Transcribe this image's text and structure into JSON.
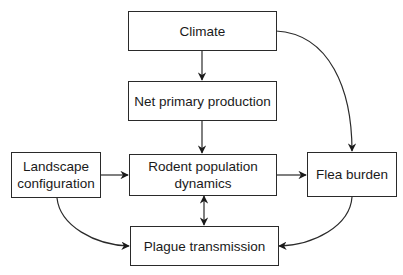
{
  "diagram": {
    "type": "flowchart",
    "nodes": [
      {
        "id": "climate",
        "label": "Climate"
      },
      {
        "id": "npp",
        "label": "Net primary production"
      },
      {
        "id": "landscape",
        "label": "Landscape configuration"
      },
      {
        "id": "rodent",
        "label": "Rodent population dynamics"
      },
      {
        "id": "flea",
        "label": "Flea burden"
      },
      {
        "id": "plague",
        "label": "Plague transmission"
      }
    ],
    "edges": [
      {
        "from": "climate",
        "to": "npp",
        "style": "straight"
      },
      {
        "from": "climate",
        "to": "flea",
        "style": "curved"
      },
      {
        "from": "npp",
        "to": "rodent",
        "style": "straight"
      },
      {
        "from": "landscape",
        "to": "rodent",
        "style": "straight"
      },
      {
        "from": "rodent",
        "to": "flea",
        "style": "straight"
      },
      {
        "from": "rodent",
        "to": "plague",
        "style": "straight",
        "bidirectional": true
      },
      {
        "from": "landscape",
        "to": "plague",
        "style": "curved"
      },
      {
        "from": "flea",
        "to": "plague",
        "style": "curved"
      }
    ]
  },
  "labels": {
    "climate": "Climate",
    "npp": "Net primary production",
    "landscape_line1": "Landscape",
    "landscape_line2": "configuration",
    "rodent_line1": "Rodent population",
    "rodent_line2": "dynamics",
    "flea": "Flea burden",
    "plague": "Plague transmission"
  }
}
